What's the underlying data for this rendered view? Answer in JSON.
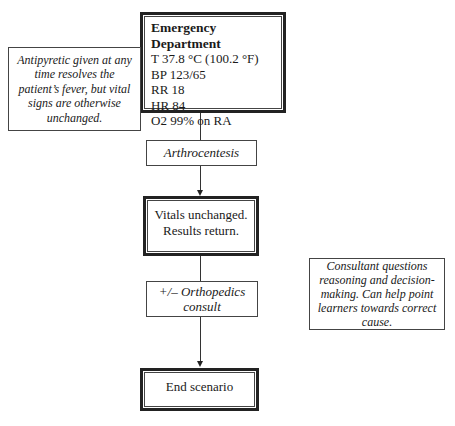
{
  "diagram": {
    "type": "flowchart",
    "nodes": {
      "emergency_department": {
        "title": "Emergency Department",
        "lines": [
          "T 37.8 °C (100.2 °F)",
          "BP 123/65",
          "RR 18",
          "HR 84",
          "O2 99% on RA"
        ]
      },
      "arthrocentesis": {
        "label": "Arthrocentesis"
      },
      "vitals": {
        "lines": [
          "Vitals unchanged.",
          "Results return."
        ]
      },
      "ortho_consult": {
        "lines": [
          "+/– Orthopedics",
          "consult"
        ]
      },
      "end": {
        "label": "End scenario"
      }
    },
    "notes": {
      "left": "Antipyretic given at any time resolves the patient’s fever, but vital signs are otherwise unchanged.",
      "right": "Consultant questions reasoning and decision-making. Can help point learners towards correct cause."
    },
    "edges": [
      {
        "from": "emergency_department",
        "to": "arthrocentesis"
      },
      {
        "from": "arthrocentesis",
        "to": "vitals"
      },
      {
        "from": "vitals",
        "to": "ortho_consult"
      },
      {
        "from": "ortho_consult",
        "to": "end"
      }
    ]
  }
}
